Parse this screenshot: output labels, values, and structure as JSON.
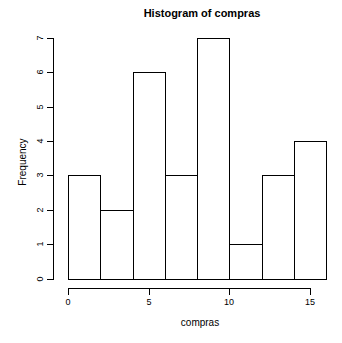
{
  "figure": {
    "background": "#ffffff"
  },
  "chart_data": {
    "type": "bar",
    "subtype": "histogram",
    "title": "Histogram of compras",
    "xlabel": "compras",
    "ylabel": "Frequency",
    "bin_edges": [
      0,
      2,
      4,
      6,
      8,
      10,
      12,
      14,
      16
    ],
    "categories": [
      "0-2",
      "2-4",
      "4-6",
      "6-8",
      "8-10",
      "10-12",
      "12-14",
      "14-16"
    ],
    "values": [
      3,
      2,
      6,
      3,
      7,
      1,
      3,
      4
    ],
    "x_ticks": [
      0,
      5,
      10,
      15
    ],
    "y_ticks": [
      0,
      1,
      2,
      3,
      4,
      5,
      6,
      7
    ],
    "xlim": [
      0,
      16
    ],
    "ylim": [
      0,
      7
    ],
    "grid": false,
    "legend": false,
    "bar_fill": "#ffffff",
    "bar_border": "#000000",
    "axis_color": "#000000",
    "text_color": "#000000"
  }
}
